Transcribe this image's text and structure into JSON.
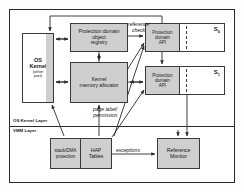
{
  "diagram": {
    "layers": [
      {
        "name": "os-kernel-layer",
        "label": "OS Kernel Layer"
      },
      {
        "name": "vmm-layer",
        "label": "VMM Layer"
      }
    ],
    "nodes": {
      "os_kernel": {
        "line1": "OS",
        "line2": "Kernel",
        "sub1": "(other",
        "sub2": "part)"
      },
      "pdo_registry": {
        "line1": "Protection domain",
        "line2": "object",
        "line3": "registry"
      },
      "kernel_memory_allocator": {
        "line1": "Kernel",
        "line2": "memory allocator"
      },
      "protection_domain_api_0": {
        "line1": "Protection",
        "line2": "domain",
        "line3": "API"
      },
      "protection_domain_api_1": {
        "line1": "Protection",
        "line2": "domain",
        "line3": "API"
      },
      "subject_0_label": "S",
      "subject_0_sub": "0",
      "subject_1_label": "S",
      "subject_1_sub": "1",
      "stack_dma": {
        "line1": "stack/DMA",
        "line2": "protection"
      },
      "hap_tables": {
        "line1": "HAP",
        "line2": "Tables"
      },
      "reference_monitor": {
        "line1": "Reference",
        "line2": "Monitor"
      }
    },
    "edge_labels": {
      "reference_check_line1": "reference",
      "reference_check_line2": "check",
      "page_label_line1": "page label/",
      "page_label_line2": "permission",
      "exceptions": "exceptions"
    },
    "colors": {
      "node_fill": "#cfcfcf",
      "node_stroke": "#3a3a3a",
      "frame_stroke": "#2b2b2b",
      "page_background": "#ffffff",
      "text": "#1a1a1a"
    }
  }
}
